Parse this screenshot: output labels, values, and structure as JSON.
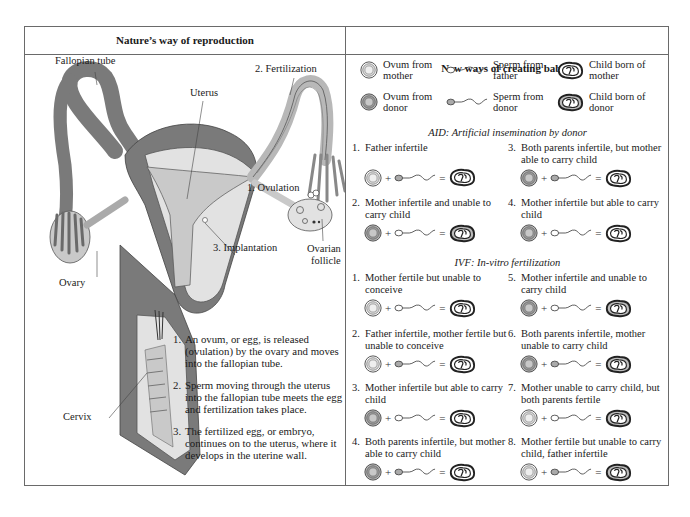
{
  "left_panel": {
    "title": "Nature’s way of reproduction",
    "labels": {
      "fallopian_tube": "Fallopian tube",
      "uterus": "Uterus",
      "fertilization": "2.  Fertilization",
      "ovulation": "1.  Ovulation",
      "implantation": "3.  Implantation",
      "ovarian_follicle_1": "Ovarian",
      "ovarian_follicle_2": "follicle",
      "ovary": "Ovary",
      "cervix": "Cervix"
    },
    "steps": [
      {
        "num": "1.",
        "text": "An ovum, or egg, is released (ovulation) by the ovary and moves into the fallopian tube."
      },
      {
        "num": "2.",
        "text": "Sperm moving through the uterus into the fallopian tube meets the egg and fertilization takes place."
      },
      {
        "num": "3.",
        "text": "The fertilized egg, or embryo, continues on to the uterus, where it develops in the uterine wall."
      }
    ],
    "colors": {
      "tissue_dark": "#7a7a7a",
      "tissue_light": "#c9c9c9",
      "tissue_pale": "#e2e2e2"
    }
  },
  "right_panel": {
    "title": "New ways of creating babies",
    "legend": [
      {
        "icon": "ovum-mother-icon",
        "text": "Ovum from mother"
      },
      {
        "icon": "sperm-father-icon",
        "text": "Sperm from father"
      },
      {
        "icon": "child-mother-icon",
        "text": "Child born of mother"
      },
      {
        "icon": "ovum-donor-icon",
        "text": "Ovum from donor"
      },
      {
        "icon": "sperm-donor-icon",
        "text": "Sperm from donor"
      },
      {
        "icon": "child-donor-icon",
        "text": "Child born of donor"
      }
    ],
    "operators": {
      "plus": "+",
      "equals": "="
    },
    "aid": {
      "title": "AID: Artificial insemination by donor",
      "cases": [
        {
          "num": "1.",
          "text": "Father infertile"
        },
        {
          "num": "2.",
          "text": "Mother infertile and unable to carry child"
        },
        {
          "num": "3.",
          "text": "Both parents infertile, but mother able to carry child"
        },
        {
          "num": "4.",
          "text": "Mother infertile but able to carry child"
        }
      ]
    },
    "ivf": {
      "title": "IVF: In-vitro fertilization",
      "cases": [
        {
          "num": "1.",
          "text": "Mother fertile but unable to conceive"
        },
        {
          "num": "2.",
          "text": "Father infertile, mother fertile but unable to conceive"
        },
        {
          "num": "3.",
          "text": "Mother infertile but able to carry child"
        },
        {
          "num": "4.",
          "text": "Both parents infertile, but mother able to carry child"
        },
        {
          "num": "5.",
          "text": "Mother infertile and unable to carry child"
        },
        {
          "num": "6.",
          "text": "Both parents infertile, mother unable to carry child"
        },
        {
          "num": "7.",
          "text": "Mother unable to carry child, but both parents fertile"
        },
        {
          "num": "8.",
          "text": "Mother fertile but unable to carry child, father infertile"
        }
      ]
    }
  }
}
